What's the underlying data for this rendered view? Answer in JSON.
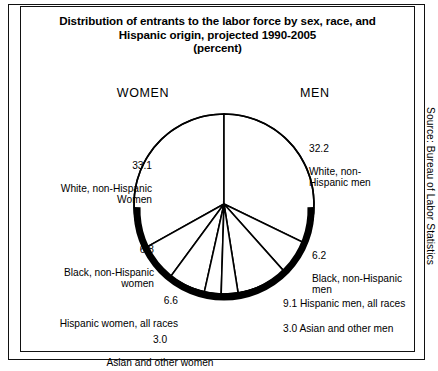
{
  "figure": {
    "title_lines": [
      "Distribution of entrants to the labor force by sex, race, and",
      "Hispanic origin, projected 1990-2005",
      "(percent)"
    ],
    "women_heading": "WOMEN",
    "men_heading": "MEN",
    "source_note": "Source: Bureau of Labor Statistics"
  },
  "labels": {
    "white_women": {
      "value": "33.1",
      "text": "White, non-Hispanic\nWomen"
    },
    "black_women": {
      "value": "6.8",
      "text": "Black, non-Hispanic\nwomen"
    },
    "hispanic_women": {
      "value": "6.6",
      "text": "Hispanic women, all races"
    },
    "asian_women": {
      "value": "3.0",
      "text": "Asian and other women"
    },
    "white_men": {
      "value": "32.2",
      "text": "White, non-\nHispanic men"
    },
    "black_men": {
      "value": "6.2",
      "text": "Black, non-Hispanic\nmen"
    },
    "hispanic_men": {
      "text": "9.1 Hispanic men, all races"
    },
    "asian_men": {
      "text": "3.0 Asian and other men"
    }
  },
  "colors": {
    "ink": "#000000",
    "paper": "#ffffff",
    "slice_fill": "#ffffff",
    "rim_shadow": "#000000"
  },
  "chart_data": {
    "type": "pie",
    "title": "Distribution of entrants to the labor force by sex, race, and Hispanic origin, projected 1990-2005 (percent)",
    "unit": "percent",
    "total": 100.0,
    "legend_position": "callout-labels",
    "grid": false,
    "groups": [
      "WOMEN",
      "MEN"
    ],
    "group_totals": {
      "WOMEN": 49.5,
      "MEN": 50.5
    },
    "labels": [
      "White, non-Hispanic Women",
      "Black, non-Hispanic women",
      "Hispanic women, all races",
      "Asian and other women",
      "Asian and other men",
      "Hispanic men, all races",
      "Black, non-Hispanic men",
      "White, non-Hispanic men"
    ],
    "values": [
      33.1,
      6.8,
      6.6,
      3.0,
      3.0,
      9.1,
      6.2,
      32.2
    ],
    "slices": [
      {
        "label": "White, non-Hispanic Women",
        "value": 33.1,
        "group": "WOMEN"
      },
      {
        "label": "Black, non-Hispanic women",
        "value": 6.8,
        "group": "WOMEN"
      },
      {
        "label": "Hispanic women, all races",
        "value": 6.6,
        "group": "WOMEN"
      },
      {
        "label": "Asian and other women",
        "value": 3.0,
        "group": "WOMEN"
      },
      {
        "label": "Asian and other men",
        "value": 3.0,
        "group": "MEN"
      },
      {
        "label": "Hispanic men, all races",
        "value": 9.1,
        "group": "MEN"
      },
      {
        "label": "Black, non-Hispanic men",
        "value": 6.2,
        "group": "MEN"
      },
      {
        "label": "White, non-Hispanic men",
        "value": 32.2,
        "group": "MEN"
      }
    ],
    "start_angle_deg": 180,
    "direction": "counterclockwise-from-top-for-women",
    "geometry": {
      "cx": 224,
      "cy": 204,
      "r": 90
    }
  }
}
